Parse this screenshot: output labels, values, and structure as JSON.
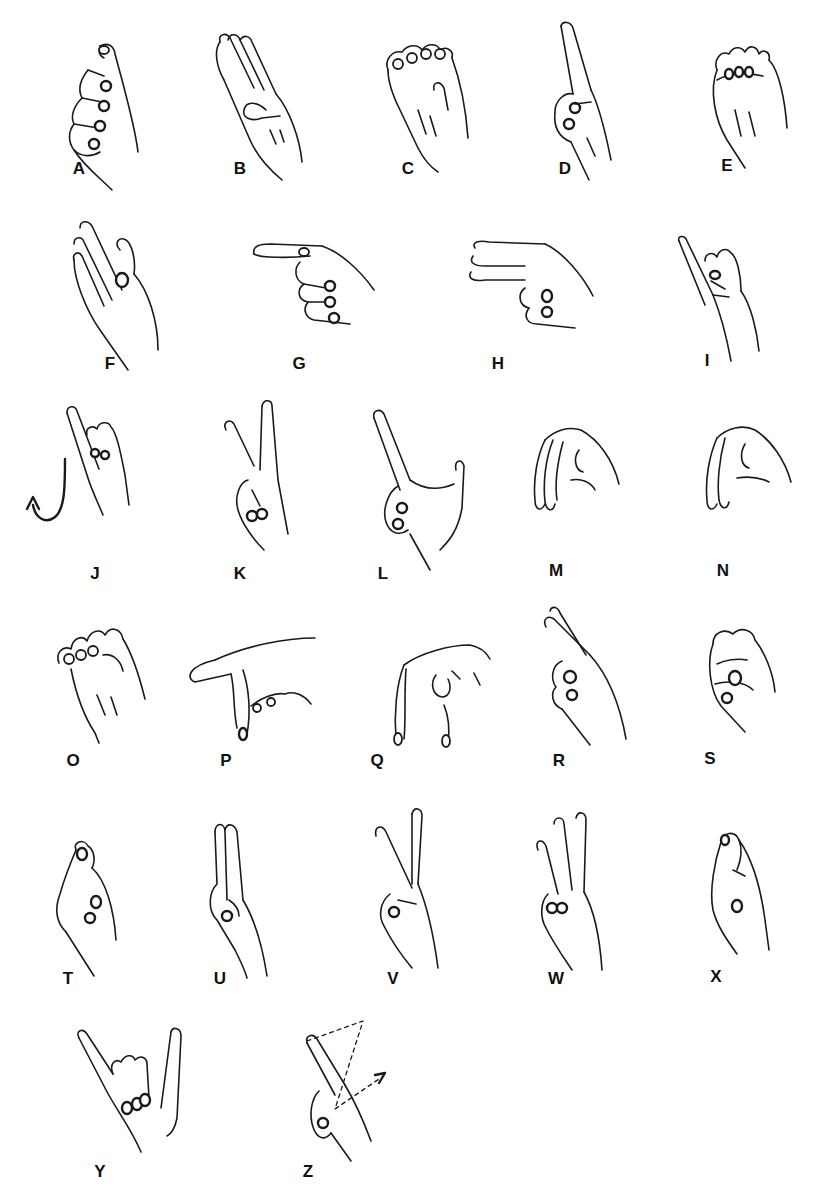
{
  "title": "",
  "letters": [
    {
      "letter": "A",
      "label_x": 79,
      "label_y": 160,
      "art": "fist-thumb-side",
      "ox": 60,
      "oy": 40
    },
    {
      "letter": "B",
      "label_x": 240,
      "label_y": 160,
      "art": "flat-hand-thumb-across",
      "ox": 210,
      "oy": 30
    },
    {
      "letter": "C",
      "label_x": 408,
      "label_y": 160,
      "art": "curved-hand",
      "ox": 378,
      "oy": 40
    },
    {
      "letter": "D",
      "label_x": 565,
      "label_y": 160,
      "art": "index-up",
      "ox": 545,
      "oy": 20
    },
    {
      "letter": "E",
      "label_x": 727,
      "label_y": 157,
      "art": "fingers-curled-over-thumb",
      "ox": 705,
      "oy": 40
    },
    {
      "letter": "F",
      "label_x": 110,
      "label_y": 355,
      "art": "ok-three-up",
      "ox": 70,
      "oy": 220
    },
    {
      "letter": "G",
      "label_x": 299,
      "label_y": 355,
      "art": "index-point-side",
      "ox": 250,
      "oy": 240
    },
    {
      "letter": "H",
      "label_x": 498,
      "label_y": 355,
      "art": "two-point-side",
      "ox": 465,
      "oy": 240
    },
    {
      "letter": "I",
      "label_x": 707,
      "label_y": 352,
      "art": "pinky-up",
      "ox": 675,
      "oy": 235
    },
    {
      "letter": "J",
      "label_x": 95,
      "label_y": 565,
      "art": "pinky-up-hook-arrow",
      "ox": 25,
      "oy": 405
    },
    {
      "letter": "K",
      "label_x": 240,
      "label_y": 565,
      "art": "two-up-thumb-between",
      "ox": 220,
      "oy": 400
    },
    {
      "letter": "L",
      "label_x": 383,
      "label_y": 565,
      "art": "index-thumb-l",
      "ox": 370,
      "oy": 410
    },
    {
      "letter": "M",
      "label_x": 556,
      "label_y": 562,
      "art": "three-over-thumb-down",
      "ox": 525,
      "oy": 420
    },
    {
      "letter": "N",
      "label_x": 723,
      "label_y": 562,
      "art": "two-over-thumb-down",
      "ox": 695,
      "oy": 420
    },
    {
      "letter": "O",
      "label_x": 73,
      "label_y": 752,
      "art": "o-shape",
      "ox": 55,
      "oy": 615
    },
    {
      "letter": "P",
      "label_x": 226,
      "label_y": 752,
      "art": "index-forward-middle-down",
      "ox": 185,
      "oy": 630
    },
    {
      "letter": "Q",
      "label_x": 377,
      "label_y": 752,
      "art": "index-thumb-down",
      "ox": 390,
      "oy": 635
    },
    {
      "letter": "R",
      "label_x": 559,
      "label_y": 752,
      "art": "crossed-fingers",
      "ox": 540,
      "oy": 605
    },
    {
      "letter": "S",
      "label_x": 710,
      "label_y": 750,
      "art": "fist-thumb-front",
      "ox": 705,
      "oy": 620
    },
    {
      "letter": "T",
      "label_x": 68,
      "label_y": 970,
      "art": "thumb-between-fingers",
      "ox": 50,
      "oy": 840
    },
    {
      "letter": "U",
      "label_x": 220,
      "label_y": 970,
      "art": "two-up-together",
      "ox": 205,
      "oy": 820
    },
    {
      "letter": "V",
      "label_x": 393,
      "label_y": 970,
      "art": "two-up-spread",
      "ox": 372,
      "oy": 808
    },
    {
      "letter": "W",
      "label_x": 556,
      "label_y": 970,
      "art": "three-up-spread",
      "ox": 532,
      "oy": 810
    },
    {
      "letter": "X",
      "label_x": 716,
      "label_y": 968,
      "art": "index-hooked",
      "ox": 705,
      "oy": 830
    },
    {
      "letter": "Y",
      "label_x": 100,
      "label_y": 1163,
      "art": "thumb-pinky-out",
      "ox": 75,
      "oy": 1028
    },
    {
      "letter": "Z",
      "label_x": 308,
      "label_y": 1163,
      "art": "index-trace-z",
      "ox": 305,
      "oy": 1015
    }
  ]
}
